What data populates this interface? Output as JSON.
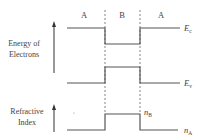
{
  "diagram": {
    "regions": [
      {
        "label": "A",
        "x": 84
      },
      {
        "label": "B",
        "x": 122
      },
      {
        "label": "A",
        "x": 161
      }
    ],
    "axes": {
      "energy": {
        "line1": "Energy of",
        "line2": "Electrons"
      },
      "refractive": {
        "line1": "Refractive",
        "line2": "Index"
      }
    },
    "levels": {
      "conduction": {
        "symbol": "E",
        "subscript": "c"
      },
      "valence": {
        "symbol": "E",
        "subscript": "v"
      },
      "index_b": {
        "symbol": "n",
        "subscript": "B"
      },
      "index_a": {
        "symbol": "n",
        "subscript": "A"
      }
    },
    "colors": {
      "line": "#555555",
      "text": "#444444",
      "background": "#ffffff"
    }
  }
}
